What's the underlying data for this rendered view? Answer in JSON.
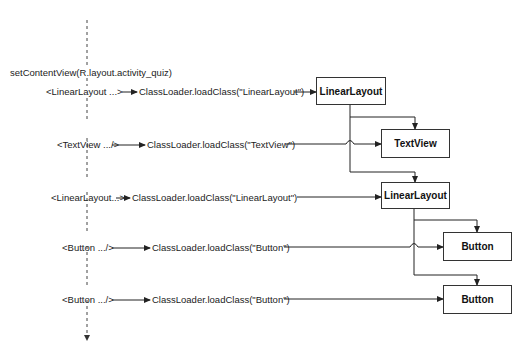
{
  "diagram": {
    "entry_call": "setContentView(R.layout.activity_quiz)",
    "rows": [
      {
        "tag": "<LinearLayout ...>",
        "call": "ClassLoader.loadClass(\"LinearLayout\")",
        "view": "LinearLayout"
      },
      {
        "tag": "<TextView .../>",
        "call": "ClassLoader.loadClass(\"TextView\")",
        "view": "TextView"
      },
      {
        "tag": "<LinearLayout...>",
        "call": "ClassLoader.loadClass(\"LinearLayout\")",
        "view": "LinearLayout"
      },
      {
        "tag": "<Button .../>",
        "call": "ClassLoader.loadClass(\"Button\")",
        "view": "Button"
      },
      {
        "tag": "<Button .../>",
        "call": "ClassLoader.loadClass(\"Button\")",
        "view": "Button"
      }
    ],
    "hierarchy": [
      {
        "parent": "LinearLayout",
        "children": [
          "TextView",
          "LinearLayout"
        ]
      },
      {
        "parent": "LinearLayout",
        "children": [
          "Button",
          "Button"
        ]
      }
    ],
    "colors": {
      "line": "#333333",
      "box_border": "#333333",
      "background": "#ffffff"
    }
  }
}
